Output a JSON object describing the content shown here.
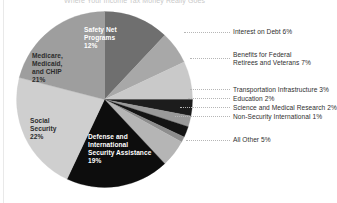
{
  "title": {
    "text": "Where Your Income Tax Money Really Goes"
  },
  "chart_data": {
    "type": "pie",
    "title": "Where Your Income Tax Money Really Goes",
    "xlabel": "",
    "ylabel": "",
    "legend_position": "callout-right",
    "grid": false,
    "units": "percent",
    "categories": [
      "Safety Net Programs",
      "Interest on Debt",
      "Benefits for Federal Retirees and Veterans",
      "Transportation Infrastructure",
      "Education",
      "Science and Medical Research",
      "Non-Security International",
      "All Other",
      "Defense and International Security Assistance",
      "Social Security",
      "Medicare, Medicaid, and CHIP"
    ],
    "values": [
      12,
      6,
      7,
      3,
      2,
      2,
      1,
      5,
      19,
      22,
      21
    ],
    "colors": [
      "#6f6f6f",
      "#a8a8a8",
      "#c9c9c9",
      "#1c1c1c",
      "#9a9a9a",
      "#141414",
      "#8d8d8d",
      "#b5b5b5",
      "#0d0d0d",
      "#cfcfcf",
      "#9e9e9e"
    ],
    "slices": [
      {
        "label": "Safety Net Programs",
        "value": 12,
        "display": "12%",
        "color": "#6f6f6f",
        "label_placement": "inside",
        "text_color": "white"
      },
      {
        "label": "Interest on Debt",
        "value": 6,
        "display": "6%",
        "color": "#a8a8a8",
        "label_placement": "callout"
      },
      {
        "label": "Benefits for Federal Retirees and Veterans",
        "value": 7,
        "display": "7%",
        "color": "#c9c9c9",
        "label_placement": "callout"
      },
      {
        "label": "Transportation Infrastructure",
        "value": 3,
        "display": "3%",
        "color": "#1c1c1c",
        "label_placement": "callout"
      },
      {
        "label": "Education",
        "value": 2,
        "display": "2%",
        "color": "#9a9a9a",
        "label_placement": "callout"
      },
      {
        "label": "Science and Medical Research",
        "value": 2,
        "display": "2%",
        "color": "#141414",
        "label_placement": "callout"
      },
      {
        "label": "Non-Security International",
        "value": 1,
        "display": "1%",
        "color": "#8d8d8d",
        "label_placement": "callout"
      },
      {
        "label": "All Other",
        "value": 5,
        "display": "5%",
        "color": "#b5b5b5",
        "label_placement": "callout"
      },
      {
        "label": "Defense and International Security Assistance",
        "value": 19,
        "display": "19%",
        "color": "#0d0d0d",
        "label_placement": "inside",
        "text_color": "white"
      },
      {
        "label": "Social Security",
        "value": 22,
        "display": "22%",
        "color": "#cfcfcf",
        "label_placement": "inside",
        "text_color": "dark"
      },
      {
        "label": "Medicare, Medicaid, and CHIP",
        "value": 21,
        "display": "21%",
        "color": "#9e9e9e",
        "label_placement": "inside",
        "text_color": "dark"
      }
    ]
  },
  "slice_labels": {
    "safety_net": "Safety Net\nPrograms\n12%",
    "medicare": "Medicare,\nMedicaid,\nand CHIP\n21%",
    "social_security": "Social\nSecurity\n22%",
    "defense": "Defense and\nInternational\nSecurity Assistance\n19%"
  },
  "callouts": {
    "interest_on_debt": "Interest on Debt 6%",
    "benefits_federal": "Benefits for Federal\nRetirees and Veterans 7%",
    "transportation": "Transportation Infrastructure 3%",
    "education": "Education 2%",
    "science": "Science and Medical Research 2%",
    "non_security": "Non-Security International 1%",
    "all_other": "All Other 5%"
  }
}
